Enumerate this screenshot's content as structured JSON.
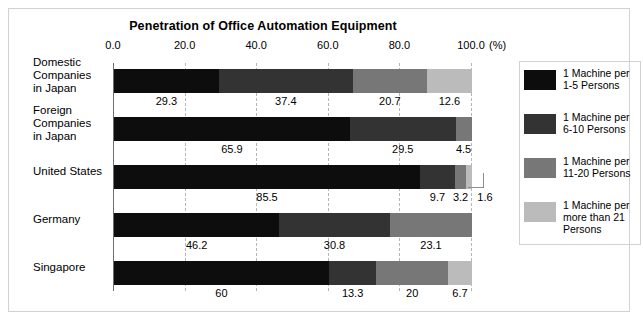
{
  "chart_data": {
    "type": "bar",
    "orientation": "horizontal",
    "stacked": true,
    "normalized_percent": true,
    "title": "Penetration of Office Automation Equipment",
    "xlabel": "(%)",
    "ylabel": "",
    "xlim": [
      0,
      100
    ],
    "xticks": [
      0.0,
      20.0,
      40.0,
      60.0,
      80.0,
      100.0
    ],
    "xtick_labels": [
      "0.0",
      "20.0",
      "40.0",
      "60.0",
      "80.0",
      "100.0"
    ],
    "grid": "vertical-dashed",
    "legend_position": "right",
    "categories": [
      "Domestic Companies in Japan",
      "Foreign Companies in Japan",
      "United States",
      "Germany",
      "Singapore"
    ],
    "series": [
      {
        "name": "1 Machine per 1-5 Persons",
        "color": "#0d0d0d",
        "values": [
          29.3,
          65.9,
          85.5,
          46.2,
          60
        ]
      },
      {
        "name": "1 Machine per 6-10 Persons",
        "color": "#333333",
        "values": [
          37.4,
          29.5,
          9.7,
          30.8,
          13.3
        ]
      },
      {
        "name": "1 Machine per 11-20 Persons",
        "color": "#777777",
        "values": [
          20.7,
          4.5,
          3.2,
          23.1,
          20
        ]
      },
      {
        "name": "1 Machine per more than 21 Persons",
        "color": "#bbbbbb",
        "values": [
          12.6,
          null,
          1.6,
          null,
          6.7
        ]
      }
    ],
    "value_labels": [
      [
        "29.3",
        "37.4",
        "20.7",
        "12.6"
      ],
      [
        "65.9",
        "29.5",
        "4.5"
      ],
      [
        "85.5",
        "9.7",
        "3.2",
        "1.6"
      ],
      [
        "46.2",
        "30.8",
        "23.1"
      ],
      [
        "60",
        "13.3",
        "20",
        "6.7"
      ]
    ],
    "annotations": [
      {
        "label": "1.6",
        "row": "United States",
        "style": "leader-elbow"
      }
    ]
  },
  "title": "Penetration of Office Automation Equipment",
  "axis": {
    "percent_suffix": "(%)",
    "ticks": [
      "0.0",
      "20.0",
      "40.0",
      "60.0",
      "80.0",
      "100.0"
    ]
  },
  "categories": [
    {
      "lines": [
        "Domestic",
        "Companies",
        "in Japan"
      ]
    },
    {
      "lines": [
        "Foreign",
        "Companies",
        "in Japan"
      ]
    },
    {
      "lines": [
        "United States"
      ]
    },
    {
      "lines": [
        "Germany"
      ]
    },
    {
      "lines": [
        "Singapore"
      ]
    }
  ],
  "legend": {
    "items": [
      {
        "lines": [
          "1 Machine per",
          "1-5 Persons"
        ],
        "color": "#0d0d0d"
      },
      {
        "lines": [
          "1 Machine per",
          "6-10 Persons"
        ],
        "color": "#333333"
      },
      {
        "lines": [
          "1 Machine per",
          "11-20 Persons"
        ],
        "color": "#777777"
      },
      {
        "lines": [
          "1 Machine per",
          "more than 21",
          "Persons"
        ],
        "color": "#bbbbbb"
      }
    ]
  }
}
